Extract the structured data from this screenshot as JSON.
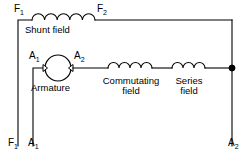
{
  "diagram": {
    "colors": {
      "wire": "#000000",
      "background": "#ffffff",
      "node": "#000000"
    },
    "terminals": {
      "f1_top": {
        "text": "F",
        "sub": "1"
      },
      "f2_top": {
        "text": "F",
        "sub": "2"
      },
      "a1_armature": {
        "text": "A",
        "sub": "1"
      },
      "a2_armature": {
        "text": "A",
        "sub": "2"
      },
      "f1_bottom": {
        "text": "F",
        "sub": "1"
      },
      "a1_bottom": {
        "text": "A",
        "sub": "1"
      },
      "a2_bottom": {
        "text": "A",
        "sub": "2"
      }
    },
    "components": [
      {
        "id": "shunt-field",
        "label": "Shunt field",
        "type": "coil",
        "turns": 5
      },
      {
        "id": "armature",
        "label": "Armature",
        "type": "machine-circle"
      },
      {
        "id": "commutating-field",
        "label_line1": "Commutating",
        "label_line2": "field",
        "type": "coil",
        "turns": 4
      },
      {
        "id": "series-field",
        "label_line1": "Series",
        "label_line2": "field",
        "type": "coil",
        "turns": 3
      }
    ],
    "labels": {
      "shunt_field": "Shunt field",
      "armature": "Armature",
      "commutating_field_line1": "Commutating",
      "commutating_field_line2": "field",
      "series_field_line1": "Series",
      "series_field_line2": "field"
    }
  }
}
